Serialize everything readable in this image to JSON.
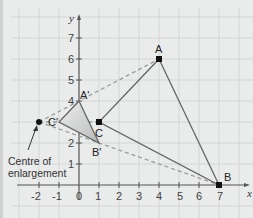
{
  "diagram": {
    "type": "enlargement",
    "axes": {
      "x_label": "x",
      "y_label": "y",
      "x_ticks": [
        "-2",
        "-1",
        "0",
        "1",
        "2",
        "3",
        "4",
        "5",
        "6",
        "7"
      ],
      "y_ticks": [
        "1",
        "2",
        "3",
        "4",
        "5",
        "6",
        "7"
      ]
    },
    "points": {
      "A": {
        "label": "A",
        "x": 4,
        "y": 6
      },
      "B": {
        "label": "B",
        "x": 7,
        "y": 0
      },
      "C": {
        "label": "C",
        "x": 1,
        "y": 3
      },
      "A_prime": {
        "label": "A'",
        "x": 0,
        "y": 4
      },
      "B_prime": {
        "label": "B'",
        "x": 1,
        "y": 2
      },
      "C_prime": {
        "label": "C'",
        "x": -1,
        "y": 3
      },
      "O": {
        "label": "",
        "x": -2,
        "y": 3
      }
    },
    "centre_label_line1": "Centre of",
    "centre_label_line2": "enlargement"
  }
}
